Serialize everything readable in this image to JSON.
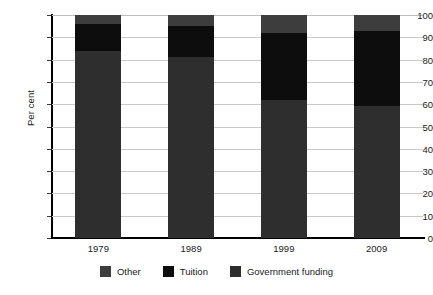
{
  "chart_data": {
    "type": "bar",
    "stacked": true,
    "title": "",
    "subtitle": "",
    "xlabel": "",
    "ylabel": "Per cent",
    "ylim": [
      0,
      100
    ],
    "ytick_step": 10,
    "ytick_labels": [
      "0",
      "10",
      "20",
      "30",
      "40",
      "50",
      "60",
      "70",
      "80",
      "90",
      "100"
    ],
    "grid": true,
    "legend_position": "bottom",
    "categories": [
      "1979",
      "1989",
      "1999",
      "2009"
    ],
    "series": [
      {
        "name": "Government funding",
        "color": "#2e2e2e",
        "values": [
          84,
          81,
          62,
          59
        ]
      },
      {
        "name": "Tuition",
        "color": "#0d0d0d",
        "values": [
          12,
          14,
          30,
          34
        ]
      },
      {
        "name": "Other",
        "color": "#3d3d3d",
        "values": [
          4,
          5,
          8,
          7
        ]
      }
    ]
  },
  "legend": {
    "items": [
      {
        "label": "Other",
        "color": "#3d3d3d"
      },
      {
        "label": "Tuition",
        "color": "#0d0d0d"
      },
      {
        "label": "Government funding",
        "color": "#2e2e2e"
      }
    ]
  },
  "axis": {
    "y_title": "Per cent"
  },
  "colors": {
    "gridline": "#c9c9c9",
    "axis": "#000000",
    "background": "#ffffff",
    "text": "#1a1a1a"
  }
}
